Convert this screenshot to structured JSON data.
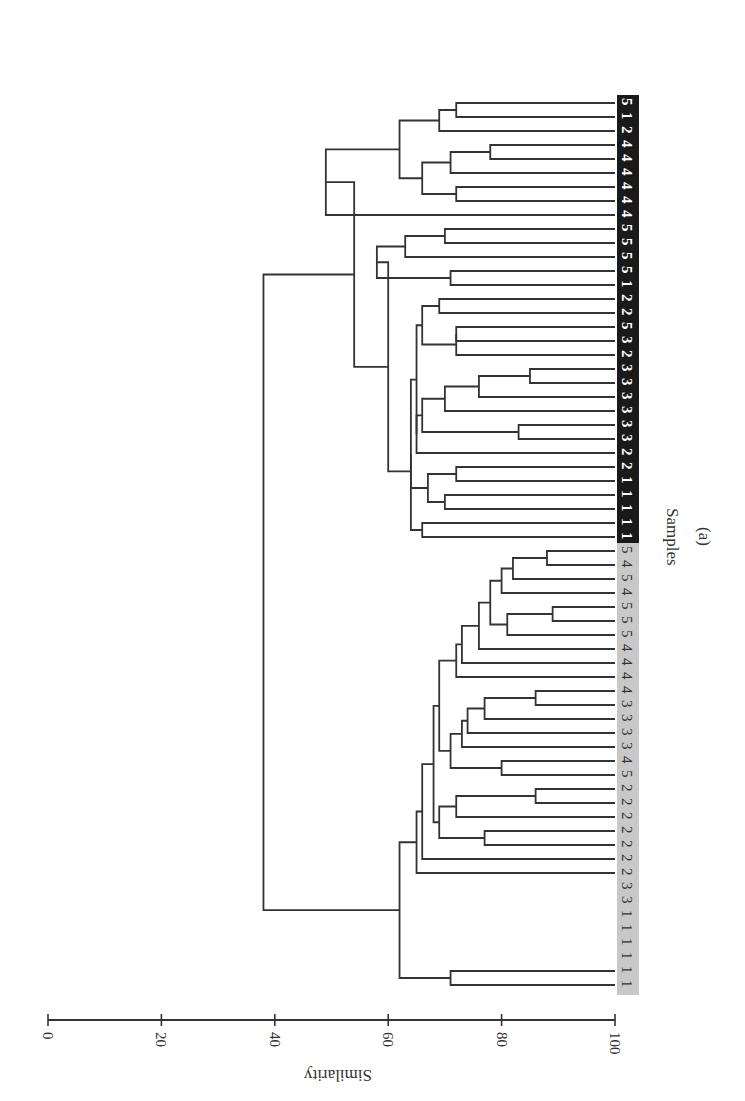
{
  "chart_data": {
    "type": "dendrogram",
    "orientation": "rotated 90 degrees clockwise (root on left, leaves on right)",
    "xlabel": "Samples",
    "ylabel": "Similarity",
    "caption": "(a)",
    "ylim": [
      0,
      100
    ],
    "yticks": [
      0,
      20,
      40,
      60,
      80,
      100
    ],
    "groups": [
      {
        "name": "group-black",
        "background": "#1a1a1a",
        "text_color": "#ffffff",
        "labels": [
          "5",
          "1",
          "2",
          "4",
          "4",
          "4",
          "4",
          "4",
          "4",
          "5",
          "5",
          "5",
          "5",
          "1",
          "2",
          "2",
          "5",
          "3",
          "2",
          "3",
          "3",
          "3",
          "3",
          "3",
          "3",
          "2",
          "2",
          "1",
          "1",
          "1",
          "1",
          "1"
        ]
      },
      {
        "name": "group-grey",
        "background": "#c8c8c8",
        "text_color": "#333333",
        "labels": [
          "5",
          "4",
          "5",
          "4",
          "5",
          "5",
          "5",
          "4",
          "4",
          "4",
          "4",
          "3",
          "3",
          "3",
          "3",
          "4",
          "5",
          "2",
          "2",
          "2",
          "2",
          "2",
          "2",
          "2",
          "3",
          "3",
          "1",
          "1",
          "1",
          "1",
          "1",
          "1"
        ]
      }
    ],
    "root_similarity": 38,
    "cluster_similarities": {
      "black_cluster": 53,
      "grey_cluster": 62
    }
  },
  "axis": {
    "label": "Similarity",
    "ticks": [
      "0",
      "20",
      "40",
      "60",
      "80",
      "100"
    ]
  },
  "samples_label": "Samples",
  "caption": "(a)"
}
